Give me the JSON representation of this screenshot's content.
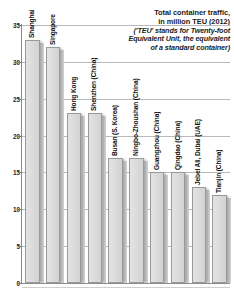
{
  "chart_data": {
    "type": "bar",
    "title": "Total container traffic, in million TEU (2012)",
    "title_lines": [
      "Total container traffic,",
      "in million TEU (2012)"
    ],
    "subtitle": "('TEU' stands for Twenty-foot Equivalent Unit, the equivalent of a standard container)",
    "subtitle_lines": [
      "('TEU' stands for Twenty-foot",
      "Equivalent Unit, the equivalent",
      "of a standard container)"
    ],
    "xlabel": "",
    "ylabel": "",
    "ylim": [
      0,
      35
    ],
    "yticks": [
      0,
      5,
      10,
      15,
      20,
      25,
      30,
      35
    ],
    "ytick_labels": [
      "0",
      "5",
      "10",
      "15",
      "20",
      "25",
      "30",
      "35"
    ],
    "grid": true,
    "legend": "none",
    "bar_color": "#dcdcdc",
    "bar_edge_color": "#9a9a9a",
    "categories": [
      "Shanghai",
      "Singapore",
      "Hong Kong",
      "Shenzhen (China)",
      "Busan (S. Korea)",
      "Ningbo-Zhoushan (China)",
      "Guangzhou (China)",
      "Qingdao (China)",
      "Jebel Ali, Dubai (UAE)",
      "Tianjin (China)"
    ],
    "values": [
      33,
      32,
      23,
      23,
      17,
      17,
      15,
      15,
      13,
      12
    ]
  }
}
